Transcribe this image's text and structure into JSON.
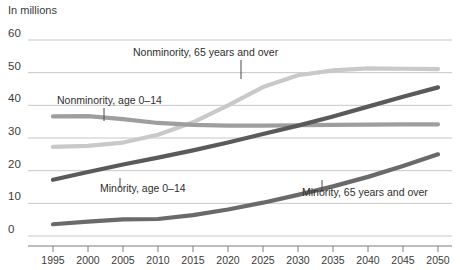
{
  "chart_data": {
    "type": "line",
    "title": "",
    "subtitle": "",
    "units_label": "In millions",
    "xlabel": "",
    "ylabel": "",
    "xlim": [
      1995,
      2050
    ],
    "ylim": [
      0,
      60
    ],
    "x": [
      1995,
      2000,
      2005,
      2010,
      2015,
      2020,
      2025,
      2030,
      2035,
      2040,
      2045,
      2050
    ],
    "x_ticks": [
      "1995",
      "2000",
      "2005",
      "2010",
      "2015",
      "2020",
      "2025",
      "2030",
      "2035",
      "2040",
      "2045",
      "2050"
    ],
    "y_ticks": [
      "0",
      "10",
      "20",
      "30",
      "40",
      "50",
      "60"
    ],
    "y_tick_values": [
      0,
      10,
      20,
      30,
      40,
      50,
      60
    ],
    "grid": true,
    "legend_position": "inline-annotations",
    "series": [
      {
        "name": "Nonminority, 65 years and over",
        "color": "#c9c9c9",
        "values": [
          27.3,
          27.6,
          28.6,
          31.0,
          34.8,
          40.0,
          45.6,
          49.2,
          50.7,
          51.3,
          51.2,
          51.1
        ]
      },
      {
        "name": "Nonminority, age 0-14",
        "color": "#9e9e9e",
        "values": [
          36.6,
          36.7,
          35.8,
          34.6,
          34.0,
          33.8,
          33.8,
          33.9,
          34.0,
          34.1,
          34.2,
          34.2
        ]
      },
      {
        "name": "Minority, age 0-14",
        "color": "#5a5a5a",
        "values": [
          17.2,
          19.6,
          21.9,
          24.0,
          26.2,
          28.6,
          31.2,
          33.8,
          36.6,
          39.6,
          42.6,
          45.5
        ]
      },
      {
        "name": "Minority, 65 years and over",
        "color": "#6a6a6a",
        "values": [
          3.6,
          4.4,
          5.1,
          5.2,
          6.4,
          8.1,
          10.2,
          12.6,
          15.2,
          18.1,
          21.4,
          25.0
        ]
      }
    ],
    "annotations": [
      {
        "label": "Nonminority, 65 years and over",
        "text_x": 133,
        "text_y": 56,
        "leader_x": 241,
        "leader_y1": 60,
        "leader_y2": 79
      },
      {
        "label": "Nonminority, age 0–14",
        "text_x": 57,
        "text_y": 104,
        "leader_x": 104,
        "leader_y1": 108,
        "leader_y2": 121
      },
      {
        "label": "Minority, age 0–14",
        "text_x": 100,
        "text_y": 192,
        "leader_x": 120,
        "leader_y1": 178,
        "leader_y2": 188
      },
      {
        "label": "Minority, 65 years and over",
        "text_x": 302,
        "text_y": 196,
        "leader_x": 322,
        "leader_y1": 180,
        "leader_y2": 192
      }
    ]
  }
}
